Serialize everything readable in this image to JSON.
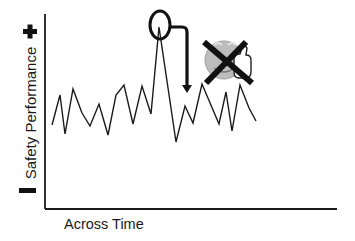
{
  "chart_data": {
    "type": "line",
    "title": "",
    "xlabel": "Across Time",
    "ylabel": "Safety Performance",
    "y_top_marker": "+",
    "y_bottom_marker": "−",
    "grid": false,
    "legend": null,
    "axis_pixels": {
      "origin": [
        45,
        209
      ],
      "y_top": 14,
      "x_end": 337
    },
    "points_px": [
      [
        52,
        125
      ],
      [
        60,
        95
      ],
      [
        65,
        134
      ],
      [
        73,
        89
      ],
      [
        82,
        113
      ],
      [
        90,
        126
      ],
      [
        99,
        104
      ],
      [
        108,
        135
      ],
      [
        116,
        95
      ],
      [
        124,
        85
      ],
      [
        133,
        124
      ],
      [
        142,
        86
      ],
      [
        151,
        114
      ],
      [
        159,
        27
      ],
      [
        176,
        142
      ],
      [
        185,
        106
      ],
      [
        193,
        123
      ],
      [
        202,
        84
      ],
      [
        219,
        124
      ],
      [
        226,
        92
      ],
      [
        232,
        131
      ],
      [
        240,
        85
      ],
      [
        249,
        108
      ],
      [
        256,
        121
      ]
    ],
    "annotations": [
      {
        "type": "circle",
        "label": "peak highlighted",
        "cx": 160,
        "cy": 25,
        "rx": 10,
        "ry": 14
      },
      {
        "type": "arrow",
        "label": "arrow down from peak",
        "path": "M171,27 H182 Q187,27 187,32 V88"
      },
      {
        "type": "icon",
        "label": "crossed-out thumbs-up smiley",
        "cx": 226,
        "cy": 60
      }
    ],
    "colors": {
      "line": "#1a1a1a",
      "axis": "#1a1a1a",
      "smiley": "#bdbdbd",
      "cross": "#111111"
    }
  },
  "labels": {
    "ylabel": "Safety Performance",
    "xlabel": "Across Time"
  }
}
